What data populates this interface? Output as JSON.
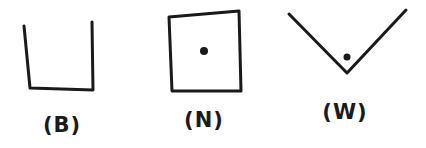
{
  "figures": [
    {
      "id": "B",
      "label": "(B)",
      "shape": "open-box-u",
      "has_dot": false
    },
    {
      "id": "N",
      "label": "(N)",
      "shape": "closed-square",
      "has_dot": true
    },
    {
      "id": "W",
      "label": "(W)",
      "shape": "v-wedge",
      "has_dot": true
    }
  ],
  "colors": {
    "ink": "#1a1a1a",
    "background": "#ffffff"
  }
}
